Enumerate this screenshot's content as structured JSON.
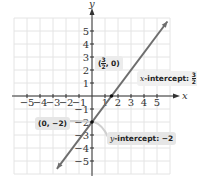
{
  "chart_data": {
    "type": "line",
    "title": "",
    "xlabel": "x",
    "ylabel": "y",
    "xlim": [
      -6,
      6
    ],
    "ylim": [
      -6,
      6
    ],
    "grid": true,
    "x_ticks": [
      "-5",
      "-4",
      "-3",
      "-2",
      "-1",
      "1",
      "2",
      "3",
      "4",
      "5"
    ],
    "y_ticks": [
      "5",
      "4",
      "3",
      "2",
      "1",
      "-1",
      "-2",
      "-3",
      "-4",
      "-5"
    ],
    "series": [
      {
        "name": "line",
        "slope": 1.3333,
        "intercept": -2,
        "x": [
          -2.7,
          5.8
        ],
        "y": [
          -5.6,
          5.73
        ],
        "color": "#6e6e6e"
      }
    ],
    "points": [
      {
        "x": 1.5,
        "y": 0,
        "label": "(3/2, 0)"
      },
      {
        "x": 0,
        "y": -2,
        "label": "(0, -2)"
      }
    ],
    "annotations": [
      {
        "text": "x-intercept: 3/2",
        "target": [
          1.5,
          0
        ]
      },
      {
        "text": "y-intercept: -2",
        "target": [
          0,
          -2
        ]
      },
      {
        "text": "(3/2, 0)",
        "target": [
          1.5,
          0
        ]
      },
      {
        "text": "(0, -2)",
        "target": [
          0,
          -2
        ]
      }
    ]
  },
  "labels": {
    "x_axis": "x",
    "y_axis": "y",
    "point_upper": {
      "open": "(",
      "num": "3",
      "den": "2",
      "rest": ", 0)"
    },
    "x_intercept": {
      "prefix": "x",
      "text": "-intercept: ",
      "num": "3",
      "den": "2"
    },
    "point_lower": "(0, −2)",
    "y_intercept": {
      "prefix": "y",
      "text": "-intercept: −2"
    }
  },
  "colors": {
    "grid": "#e4e4e4",
    "axis": "#333333",
    "line": "#6e6e6e",
    "callout_bg": "#e6e6e6"
  }
}
